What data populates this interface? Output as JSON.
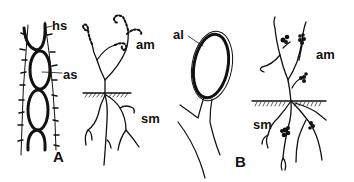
{
  "figure": {
    "panels": [
      {
        "id": "A",
        "label": "A",
        "labels": {
          "hyphal_septum": "hs",
          "aerial_segment": "as",
          "aerial_mycelium": "am",
          "substrate_mycelium": "sm"
        }
      },
      {
        "id": "B",
        "label": "B",
        "labels": {
          "aleuriospore": "al",
          "aerial_mycelium": "am",
          "substrate_mycelium": "sm"
        }
      }
    ],
    "colors": {
      "ink": "#111111",
      "background": "#ffffff"
    }
  }
}
